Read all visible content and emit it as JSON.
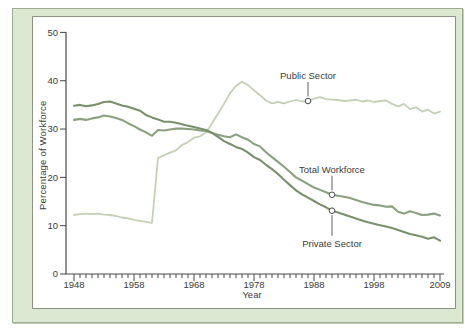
{
  "chart_data": {
    "type": "line",
    "title": "",
    "xlabel": "Year",
    "ylabel": "Percentage of Workforce",
    "xlim": [
      1948,
      2009
    ],
    "ylim": [
      0,
      50
    ],
    "grid": false,
    "y_ticks": [
      0,
      10,
      20,
      30,
      40,
      50
    ],
    "x_tick_years": [
      1948,
      1958,
      1968,
      1978,
      1988,
      1998,
      2009
    ],
    "x_minor_tick_step_years": 1,
    "legend": "inline-callout-labels",
    "colors": {
      "panel_background": "#dde8d3",
      "panel_border": "#9cac90",
      "plot_background": "#ffffff",
      "plot_border": "#8d9386",
      "axis": "#4a4a4a",
      "text": "#3d3d3d"
    },
    "series": [
      {
        "name": "Public Sector",
        "key": "public",
        "color": "#c4d1b4",
        "start_year": 1948,
        "values": [
          12.2,
          12.4,
          12.5,
          12.4,
          12.5,
          12.3,
          12.2,
          12.0,
          11.7,
          11.5,
          11.2,
          11.0,
          10.8,
          10.6,
          24.0,
          24.6,
          25.1,
          25.6,
          26.7,
          27.3,
          28.2,
          28.5,
          29.3,
          31.2,
          33.2,
          35.2,
          37.4,
          38.9,
          39.8,
          39.1,
          38.0,
          37.0,
          35.9,
          35.3,
          35.6,
          35.3,
          35.7,
          36.0,
          35.7,
          35.8,
          36.3,
          36.6,
          36.2,
          36.1,
          36.0,
          35.8,
          35.9,
          36.1,
          35.7,
          35.9,
          35.6,
          35.8,
          35.9,
          35.2,
          34.7,
          35.2,
          34.1,
          34.5,
          33.6,
          34.0,
          33.2,
          33.6
        ]
      },
      {
        "name": "Total Workforce",
        "key": "total",
        "color": "#8ba07e",
        "start_year": 1948,
        "values": [
          31.9,
          32.1,
          31.9,
          32.2,
          32.4,
          32.8,
          32.6,
          32.3,
          31.9,
          31.2,
          30.6,
          29.9,
          29.3,
          28.6,
          29.8,
          29.7,
          29.9,
          30.1,
          30.1,
          30.0,
          29.9,
          29.7,
          29.6,
          29.2,
          28.8,
          28.5,
          28.3,
          28.9,
          28.3,
          27.8,
          26.9,
          26.4,
          25.2,
          24.2,
          23.2,
          22.2,
          21.1,
          20.0,
          19.3,
          18.6,
          17.9,
          17.4,
          16.9,
          16.4,
          16.2,
          16.0,
          15.7,
          15.3,
          14.9,
          14.6,
          14.3,
          14.2,
          13.9,
          14.0,
          12.9,
          12.5,
          13.0,
          12.6,
          12.2,
          12.3,
          12.5,
          12.1
        ]
      },
      {
        "name": "Private Sector",
        "key": "private",
        "color": "#79916b",
        "start_year": 1948,
        "values": [
          34.8,
          35.0,
          34.7,
          34.9,
          35.2,
          35.6,
          35.7,
          35.3,
          34.9,
          34.6,
          34.2,
          33.8,
          32.9,
          32.4,
          32.0,
          31.5,
          31.5,
          31.3,
          31.0,
          30.7,
          30.4,
          30.1,
          29.8,
          29.2,
          28.4,
          27.5,
          26.9,
          26.3,
          25.9,
          25.1,
          24.2,
          23.6,
          22.6,
          21.7,
          20.7,
          19.5,
          18.4,
          17.3,
          16.5,
          15.8,
          15.1,
          14.4,
          13.8,
          13.1,
          12.7,
          12.3,
          11.9,
          11.5,
          11.1,
          10.7,
          10.4,
          10.1,
          9.8,
          9.5,
          9.1,
          8.7,
          8.3,
          8.0,
          7.7,
          7.3,
          7.6,
          6.9
        ]
      }
    ],
    "annotations": [
      {
        "label": "Public Sector",
        "series": "public",
        "year": 1987,
        "value": 35.8,
        "side": "above"
      },
      {
        "label": "Total Workforce",
        "series": "total",
        "year": 1991,
        "value": 16.4,
        "side": "above"
      },
      {
        "label": "Private Sector",
        "series": "private",
        "year": 1991,
        "value": 13.1,
        "side": "below"
      }
    ]
  }
}
